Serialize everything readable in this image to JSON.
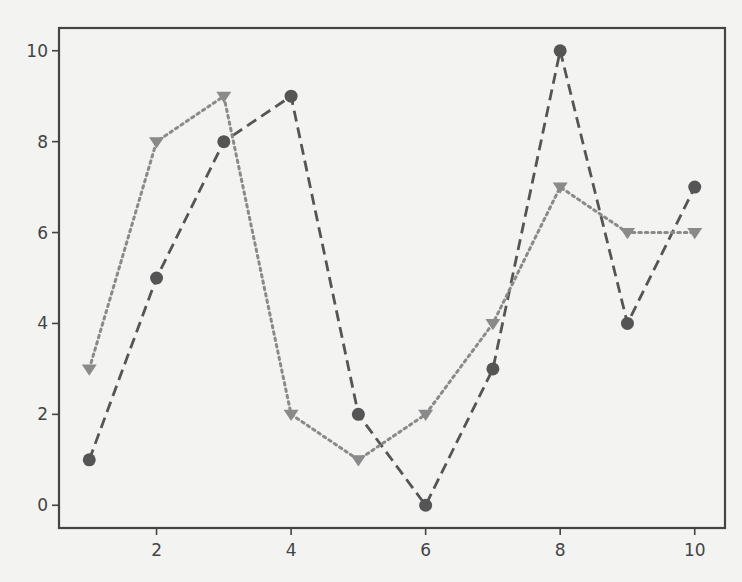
{
  "chart_data": {
    "type": "line",
    "title": "",
    "xlabel": "",
    "ylabel": "",
    "x": [
      1,
      2,
      3,
      4,
      5,
      6,
      7,
      8,
      9,
      10
    ],
    "xlim": [
      0.55,
      10.45
    ],
    "ylim": [
      -0.5,
      10.5
    ],
    "xticks": [
      2,
      4,
      6,
      8,
      10
    ],
    "yticks": [
      0,
      2,
      4,
      6,
      8,
      10
    ],
    "xtick_labels": [
      "2",
      "4",
      "6",
      "8",
      "10"
    ],
    "ytick_labels": [
      "0",
      "2",
      "4",
      "6",
      "8",
      "10"
    ],
    "grid": false,
    "legend": null,
    "series": [
      {
        "name": "series-circle-dashed",
        "marker": "circle",
        "linestyle": "dashed",
        "color": "#555555",
        "values": [
          1,
          5,
          8,
          9,
          2,
          0,
          3,
          10,
          4,
          7
        ]
      },
      {
        "name": "series-triangle-dotted",
        "marker": "triangle-down",
        "linestyle": "dotted",
        "color": "#8a8a8a",
        "values": [
          3,
          8,
          9,
          2,
          1,
          2,
          4,
          7,
          6,
          6
        ]
      }
    ]
  },
  "style": {
    "background": "#f3f3f1",
    "axis_color": "#444444",
    "tick_label_color": "#444444"
  }
}
